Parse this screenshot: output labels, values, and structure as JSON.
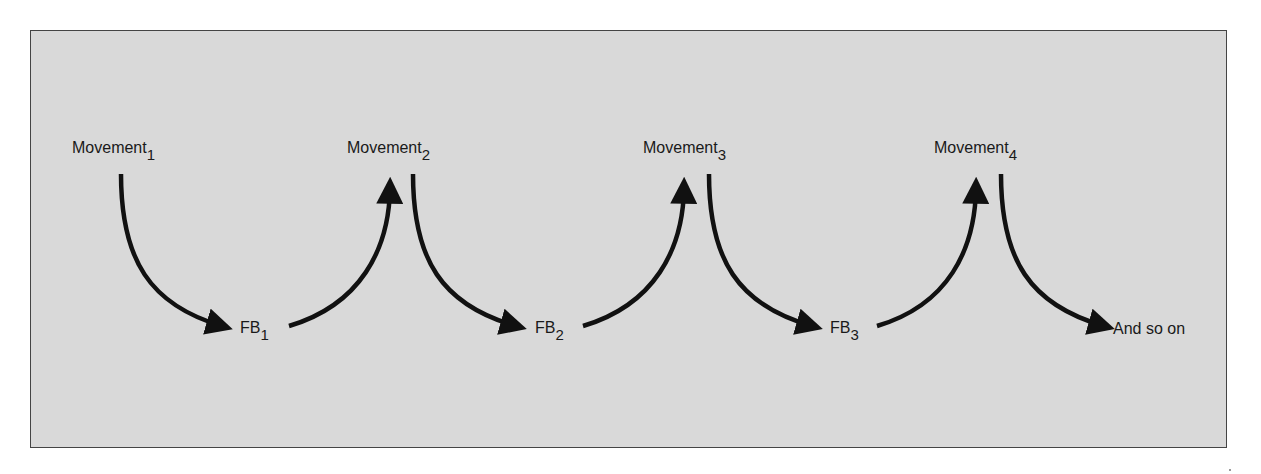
{
  "diagram": {
    "type": "feedback-loop-sequence",
    "colors": {
      "background": "#d9d9d9",
      "border": "#444444",
      "arrow": "#111111",
      "text": "#1a1a1a"
    },
    "movements": [
      {
        "label": "Movement",
        "subscript": "1"
      },
      {
        "label": "Movement",
        "subscript": "2"
      },
      {
        "label": "Movement",
        "subscript": "3"
      },
      {
        "label": "Movement",
        "subscript": "4"
      }
    ],
    "feedbacks": [
      {
        "label": "FB",
        "subscript": "1"
      },
      {
        "label": "FB",
        "subscript": "2"
      },
      {
        "label": "FB",
        "subscript": "3"
      }
    ],
    "terminal": {
      "label": "And so on"
    },
    "edges": [
      {
        "from": "Movement1",
        "to": "FB1"
      },
      {
        "from": "FB1",
        "to": "Movement2"
      },
      {
        "from": "Movement2",
        "to": "FB2"
      },
      {
        "from": "FB2",
        "to": "Movement3"
      },
      {
        "from": "Movement3",
        "to": "FB3"
      },
      {
        "from": "FB3",
        "to": "Movement4"
      },
      {
        "from": "Movement4",
        "to": "And so on"
      }
    ]
  }
}
